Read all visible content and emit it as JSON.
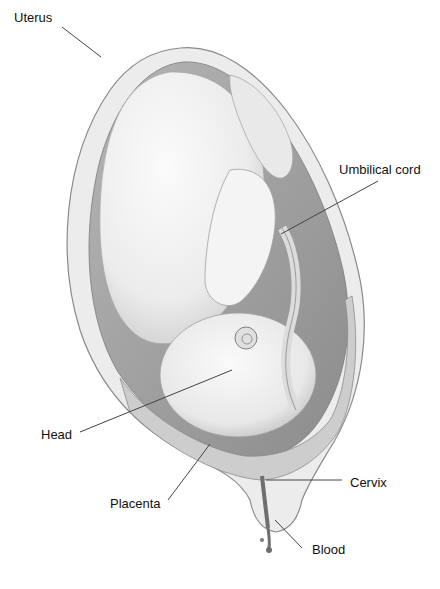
{
  "figure": {
    "colors": {
      "background": "#ffffff",
      "label_text": "#111111",
      "leader_line": "#444444",
      "uterus_wall": "#e6e6e6",
      "uterus_outline": "#8a8a8a",
      "cavity_shadow": "#9a9a9a",
      "fetus_skin": "#f2f2f2",
      "placenta": "#cfcfcf",
      "blood": "#6e6e6e"
    }
  },
  "labels": [
    {
      "id": "uterus",
      "text": "Uterus",
      "x": 14,
      "y": 11,
      "line": [
        62,
        27,
        101,
        57
      ]
    },
    {
      "id": "umbilical-cord",
      "text": "Umbilical cord",
      "x": 339,
      "y": 163,
      "line": [
        378,
        181,
        281,
        234
      ]
    },
    {
      "id": "head",
      "text": "Head",
      "x": 41,
      "y": 428,
      "line": [
        80,
        432,
        232,
        370
      ]
    },
    {
      "id": "placenta",
      "text": "Placenta",
      "x": 110,
      "y": 497,
      "line": [
        168,
        500,
        210,
        444
      ]
    },
    {
      "id": "cervix",
      "text": "Cervix",
      "x": 350,
      "y": 476,
      "line": [
        266,
        480,
        342,
        480
      ]
    },
    {
      "id": "blood",
      "text": "Blood",
      "x": 312,
      "y": 543,
      "line": [
        275,
        520,
        302,
        548
      ]
    }
  ]
}
